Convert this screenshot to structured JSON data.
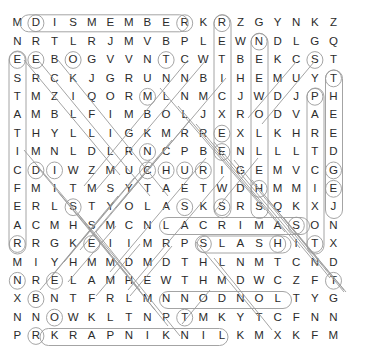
{
  "puzzle": {
    "title": "Word Search Puzzle",
    "rows": 18,
    "cols": 18,
    "grid": [
      [
        "M",
        "D",
        "I",
        "S",
        "M",
        "E",
        "M",
        "B",
        "E",
        "R",
        "K",
        "R",
        "Z",
        "G",
        "Y",
        "N",
        "K",
        "Z"
      ],
      [
        "N",
        "R",
        "T",
        "L",
        "R",
        "J",
        "M",
        "V",
        "B",
        "P",
        "L",
        "E",
        "W",
        "N",
        "D",
        "L",
        "G",
        "Q"
      ],
      [
        "E",
        "E",
        "B",
        "O",
        "G",
        "V",
        "V",
        "N",
        "T",
        "C",
        "W",
        "T",
        "B",
        "E",
        "K",
        "C",
        "S",
        "T"
      ],
      [
        "S",
        "R",
        "C",
        "K",
        "J",
        "G",
        "R",
        "U",
        "N",
        "N",
        "B",
        "I",
        "H",
        "E",
        "M",
        "U",
        "Y",
        "T"
      ],
      [
        "T",
        "M",
        "Z",
        "I",
        "Q",
        "O",
        "R",
        "M",
        "L",
        "N",
        "M",
        "C",
        "J",
        "W",
        "D",
        "J",
        "P",
        "H"
      ],
      [
        "A",
        "M",
        "B",
        "L",
        "F",
        "I",
        "M",
        "B",
        "O",
        "L",
        "J",
        "X",
        "R",
        "O",
        "D",
        "V",
        "A",
        "E"
      ],
      [
        "T",
        "H",
        "Y",
        "L",
        "L",
        "I",
        "G",
        "K",
        "M",
        "R",
        "R",
        "E",
        "X",
        "L",
        "K",
        "H",
        "R",
        "E"
      ],
      [
        "I",
        "M",
        "N",
        "L",
        "D",
        "L",
        "R",
        "N",
        "C",
        "P",
        "B",
        "E",
        "N",
        "L",
        "L",
        "L",
        "T",
        "D"
      ],
      [
        "C",
        "D",
        "I",
        "W",
        "Z",
        "M",
        "U",
        "C",
        "H",
        "U",
        "R",
        "I",
        "G",
        "E",
        "M",
        "V",
        "C",
        "G"
      ],
      [
        "F",
        "M",
        "I",
        "T",
        "M",
        "S",
        "Y",
        "T",
        "A",
        "E",
        "T",
        "W",
        "D",
        "H",
        "M",
        "M",
        "I",
        "E"
      ],
      [
        "E",
        "R",
        "L",
        "S",
        "T",
        "Y",
        "O",
        "L",
        "A",
        "S",
        "K",
        "S",
        "R",
        "S",
        "Q",
        "K",
        "X",
        "J"
      ],
      [
        "A",
        "C",
        "M",
        "H",
        "S",
        "M",
        "C",
        "N",
        "L",
        "A",
        "C",
        "R",
        "I",
        "M",
        "A",
        "S",
        "O",
        "N"
      ],
      [
        "R",
        "R",
        "G",
        "K",
        "E",
        "I",
        "I",
        "M",
        "R",
        "P",
        "S",
        "L",
        "A",
        "S",
        "H",
        "I",
        "T",
        "X"
      ],
      [
        "M",
        "I",
        "Y",
        "H",
        "M",
        "M",
        "D",
        "M",
        "D",
        "T",
        "H",
        "L",
        "N",
        "M",
        "T",
        "C",
        "N",
        "D"
      ],
      [
        "N",
        "R",
        "E",
        "L",
        "A",
        "M",
        "H",
        "E",
        "W",
        "T",
        "H",
        "M",
        "D",
        "W",
        "C",
        "Z",
        "F",
        "T"
      ],
      [
        "X",
        "B",
        "N",
        "T",
        "F",
        "R",
        "L",
        "M",
        "N",
        "N",
        "O",
        "D",
        "N",
        "O",
        "L",
        "T",
        "Y",
        "G"
      ],
      [
        "N",
        "N",
        "O",
        "W",
        "K",
        "L",
        "T",
        "N",
        "P",
        "T",
        "M",
        "K",
        "Y",
        "T",
        "C",
        "F",
        "N",
        "N"
      ],
      [
        "P",
        "R",
        "K",
        "R",
        "A",
        "P",
        "N",
        "I",
        "K",
        "N",
        "I",
        "L",
        "K",
        "M",
        "X",
        "K",
        "F",
        "M"
      ]
    ],
    "found_words": [
      {
        "text": "DISMEMBER",
        "orientation": "horizontal",
        "row": 1,
        "start_col": 2,
        "end_col": 10
      },
      {
        "text": "LACRIMAS",
        "orientation": "horizontal",
        "row": 12,
        "start_col": 9,
        "end_col": 16
      },
      {
        "text": "SLASH",
        "orientation": "horizontal",
        "row": 13,
        "start_col": 11,
        "end_col": 15
      },
      {
        "text": "NODNOL",
        "orientation": "horizontal-reversed",
        "row": 16,
        "start_col": 9,
        "end_col": 15
      },
      {
        "text": "KRAPNIKNIL",
        "orientation": "horizontal-reversed",
        "row": 18,
        "start_col": 3,
        "end_col": 12
      },
      {
        "text": "ESTATICFEAR",
        "orientation": "vertical",
        "col": 1,
        "start_row": 3,
        "end_row": 13
      },
      {
        "text": "RETICXEEIWS",
        "orientation": "vertical",
        "col": 12,
        "start_row": 1,
        "end_row": 11
      },
      {
        "text": "NEEWOLLEH",
        "orientation": "vertical",
        "col": 14,
        "start_row": 2,
        "end_row": 10
      },
      {
        "text": "PARTCIXOT",
        "orientation": "vertical",
        "col": 17,
        "start_row": 5,
        "end_row": 13
      },
      {
        "text": "THEEDGE",
        "orientation": "vertical",
        "col": 18,
        "start_row": 4,
        "end_row": 10
      }
    ],
    "circled_letters": [
      {
        "row": 1,
        "col": 2,
        "letter": "D"
      },
      {
        "row": 1,
        "col": 10,
        "letter": "R"
      },
      {
        "row": 1,
        "col": 12,
        "letter": "R"
      },
      {
        "row": 2,
        "col": 14,
        "letter": "N"
      },
      {
        "row": 3,
        "col": 1,
        "letter": "E"
      },
      {
        "row": 3,
        "col": 2,
        "letter": "E"
      },
      {
        "row": 3,
        "col": 4,
        "letter": "O"
      },
      {
        "row": 3,
        "col": 9,
        "letter": "T"
      },
      {
        "row": 3,
        "col": 17,
        "letter": "S"
      },
      {
        "row": 4,
        "col": 18,
        "letter": "T"
      },
      {
        "row": 5,
        "col": 8,
        "letter": "M"
      },
      {
        "row": 5,
        "col": 17,
        "letter": "P"
      },
      {
        "row": 7,
        "col": 12,
        "letter": "E"
      },
      {
        "row": 8,
        "col": 8,
        "letter": "N"
      },
      {
        "row": 8,
        "col": 12,
        "letter": "E"
      },
      {
        "row": 9,
        "col": 2,
        "letter": "D"
      },
      {
        "row": 9,
        "col": 3,
        "letter": "I"
      },
      {
        "row": 9,
        "col": 8,
        "letter": "C"
      },
      {
        "row": 9,
        "col": 9,
        "letter": "H"
      },
      {
        "row": 9,
        "col": 10,
        "letter": "U"
      },
      {
        "row": 9,
        "col": 11,
        "letter": "R"
      },
      {
        "row": 9,
        "col": 18,
        "letter": "G"
      },
      {
        "row": 10,
        "col": 14,
        "letter": "H"
      },
      {
        "row": 10,
        "col": 18,
        "letter": "E"
      },
      {
        "row": 11,
        "col": 4,
        "letter": "S"
      },
      {
        "row": 11,
        "col": 10,
        "letter": "S"
      },
      {
        "row": 11,
        "col": 12,
        "letter": "S"
      },
      {
        "row": 12,
        "col": 16,
        "letter": "S"
      },
      {
        "row": 13,
        "col": 1,
        "letter": "R"
      },
      {
        "row": 13,
        "col": 5,
        "letter": "E"
      },
      {
        "row": 13,
        "col": 11,
        "letter": "S"
      },
      {
        "row": 13,
        "col": 15,
        "letter": "H"
      },
      {
        "row": 13,
        "col": 17,
        "letter": "T"
      },
      {
        "row": 15,
        "col": 1,
        "letter": "N"
      },
      {
        "row": 15,
        "col": 3,
        "letter": "E"
      },
      {
        "row": 15,
        "col": 18,
        "letter": "T"
      },
      {
        "row": 16,
        "col": 2,
        "letter": "B"
      },
      {
        "row": 17,
        "col": 3,
        "letter": "O"
      },
      {
        "row": 17,
        "col": 10,
        "letter": "T"
      },
      {
        "row": 18,
        "col": 2,
        "letter": "R"
      }
    ]
  }
}
